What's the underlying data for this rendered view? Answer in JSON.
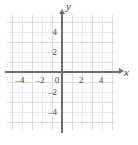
{
  "figure": {
    "type": "blank-coordinate-plane",
    "background_color": "#ffffff",
    "grid_color": "#e9e9e9",
    "grid_major_color": "#dcdcdc",
    "axis_color": "#6e6e6e",
    "label_color": "#4a4a4a"
  },
  "chart_data": {
    "type": "scatter",
    "title": "",
    "xlabel": "x",
    "ylabel": "y",
    "xlim": [
      -5.5,
      5.5
    ],
    "ylim": [
      -5.5,
      5.5
    ],
    "x_ticks": [
      -4,
      -2,
      0,
      2,
      4
    ],
    "y_ticks": [
      4,
      2,
      -2,
      -4
    ],
    "x_tick_labels": [
      "–4",
      "–2",
      "0",
      "2",
      "4"
    ],
    "y_tick_labels": [
      "4",
      "2",
      "–2",
      "–4"
    ],
    "grid": true,
    "grid_spacing": 1,
    "legend": null,
    "series": [],
    "annotations": []
  },
  "axes": {
    "x_name": "x",
    "y_name": "y",
    "origin_label": "0"
  },
  "x_ticks": [
    {
      "label": "–4",
      "px": 20
    },
    {
      "label": "–2",
      "px": 40
    },
    {
      "label": "0",
      "px": 57
    },
    {
      "label": "2",
      "px": 81
    },
    {
      "label": "4",
      "px": 101
    }
  ],
  "y_ticks": [
    {
      "label": "4",
      "px": 32
    },
    {
      "label": "2",
      "px": 52
    },
    {
      "label": "–2",
      "px": 92
    },
    {
      "label": "–4",
      "px": 112
    }
  ]
}
